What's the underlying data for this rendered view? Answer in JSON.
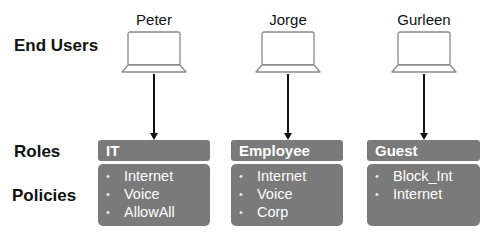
{
  "row_labels": {
    "end_users": "End Users",
    "roles": "Roles",
    "policies": "Policies"
  },
  "users": [
    {
      "name": "Peter",
      "role": "IT",
      "policies": [
        "Internet",
        "Voice",
        "AllowAll"
      ]
    },
    {
      "name": "Jorge",
      "role": "Employee",
      "policies": [
        "Internet",
        "Voice",
        "Corp"
      ]
    },
    {
      "name": "Gurleen",
      "role": "Guest",
      "policies": [
        "Block_Int",
        "Internet"
      ]
    }
  ],
  "icons": {
    "user_device": "laptop-icon",
    "connector": "arrow-down-icon",
    "list_marker": "bullet"
  },
  "colors": {
    "box_fill": "#7a7a7a",
    "box_text": "#ffffff",
    "line": "#111111",
    "laptop_stroke": "#8a8a8a"
  }
}
